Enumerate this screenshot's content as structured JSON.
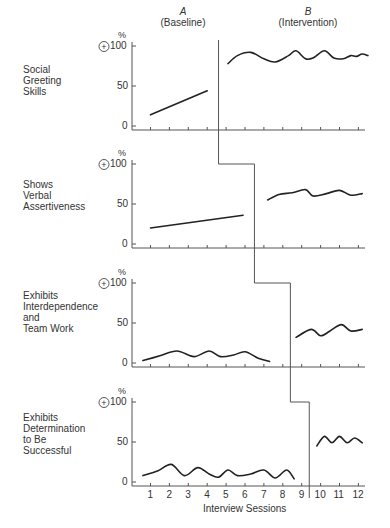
{
  "chart_data": {
    "type": "line",
    "phases": [
      {
        "letter": "A",
        "label": "(Baseline)"
      },
      {
        "letter": "B",
        "label": "(Intervention)"
      }
    ],
    "xlabel": "Interview Sessions",
    "x_ticks": [
      "1",
      "2",
      "3",
      "4",
      "5",
      "6",
      "7",
      "8",
      "9",
      "10",
      "11",
      "12"
    ],
    "y_ticks": [
      "0",
      "50",
      "100"
    ],
    "y_unit": "%",
    "ylim": [
      0,
      100
    ],
    "panels": [
      {
        "label": "Social\nGreeting\nSkills",
        "phase_change_after": 4.6,
        "baseline": {
          "x": [
            1,
            4
          ],
          "y": [
            14,
            44
          ]
        },
        "intervention": {
          "x": [
            5.1,
            5.6,
            6.3,
            7.0,
            7.6,
            8.3,
            8.7,
            9.2,
            9.6,
            10.2,
            10.7,
            11.2,
            11.6,
            11.9,
            12.2,
            12.5
          ],
          "y": [
            78,
            88,
            92,
            84,
            80,
            88,
            94,
            84,
            85,
            94,
            85,
            84,
            88,
            87,
            90,
            88
          ]
        }
      },
      {
        "label": "Shows\nVerbal\nAssertiveness",
        "phase_change_after": 6.5,
        "baseline": {
          "x": [
            1,
            5.9
          ],
          "y": [
            20,
            36
          ]
        },
        "intervention": {
          "x": [
            7.2,
            7.8,
            8.5,
            9.2,
            9.6,
            10.3,
            11.0,
            11.6,
            12.2
          ],
          "y": [
            55,
            62,
            64,
            68,
            60,
            63,
            67,
            61,
            63
          ]
        }
      },
      {
        "label": "Exhibits\nInterdependence\nand\nTeam Work",
        "phase_change_after": 8.4,
        "baseline": {
          "x": [
            0.6,
            1.5,
            2.4,
            3.3,
            4.1,
            4.7,
            5.4,
            6.0,
            6.7,
            7.3
          ],
          "y": [
            3,
            9,
            15,
            8,
            15,
            8,
            10,
            14,
            6,
            2
          ]
        },
        "intervention": {
          "x": [
            8.7,
            9.5,
            10.0,
            10.5,
            11.1,
            11.6,
            12.2
          ],
          "y": [
            32,
            42,
            34,
            40,
            48,
            40,
            42
          ]
        }
      },
      {
        "label": "Exhibits\nDetermination\nto Be\nSuccessful",
        "phase_change_after": 9.4,
        "baseline": {
          "x": [
            0.6,
            1.4,
            2.1,
            2.8,
            3.5,
            4.1,
            4.6,
            5.1,
            5.6,
            6.3,
            7.0,
            7.6,
            8.2,
            8.6
          ],
          "y": [
            8,
            14,
            22,
            8,
            18,
            10,
            6,
            15,
            8,
            10,
            15,
            5,
            15,
            4
          ]
        },
        "intervention": {
          "x": [
            9.8,
            10.2,
            10.6,
            11.0,
            11.4,
            11.8,
            12.2
          ],
          "y": [
            45,
            57,
            49,
            57,
            49,
            55,
            49
          ]
        }
      }
    ],
    "annotation_symbol": "+",
    "grid": false,
    "legend": null
  }
}
